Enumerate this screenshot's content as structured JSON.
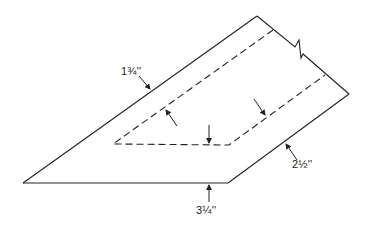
{
  "diagram": {
    "type": "technical-drawing",
    "line_color": "#222222",
    "labels": {
      "top_left_edge": "1¾''",
      "right_lower_edge": "2½''",
      "bottom_edge": "3¼''"
    }
  }
}
